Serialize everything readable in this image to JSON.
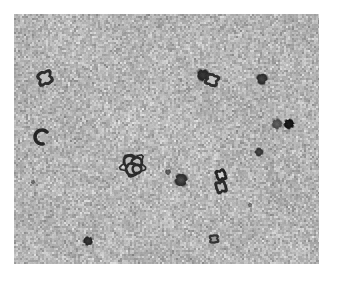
{
  "figure": {
    "kind": "electron-micrograph",
    "modality": "transmission electron microscopy, negative stain",
    "canvas": {
      "width": 337,
      "height": 281,
      "background_color": "#ffffff"
    },
    "caption": ""
  },
  "panel": {
    "label": "",
    "x": 14,
    "y": 14,
    "width": 305,
    "height": 250,
    "border_color": "#ffffff",
    "background_color": "#b2b2b2",
    "grain": {
      "description": "fine granular negative-stain background speckle",
      "min_gray": "#8e8e8e",
      "max_gray": "#d8d8d8",
      "mean_gray": "#b4b4b4",
      "cell_size_px": 2,
      "blotch_count": 140
    }
  },
  "particles": [
    {
      "id": "p01",
      "name": "ring-vesicle-upper-left",
      "shape": "ring",
      "cx": 45,
      "cy": 78,
      "r": 8.0,
      "ring_thickness": 3.2,
      "core_gray": "#c2c2c2",
      "edge_gray": "#2e2e2e"
    },
    {
      "id": "p02",
      "name": "dark-blob-upper-mid-right",
      "shape": "blob",
      "cx": 203,
      "cy": 75,
      "r": 6.5,
      "ring_thickness": 0,
      "core_gray": "#3a3a3a",
      "edge_gray": "#242424"
    },
    {
      "id": "p03",
      "name": "ring-vesicle-upper-mid-right",
      "shape": "ring",
      "cx": 212,
      "cy": 80,
      "r": 7.0,
      "ring_thickness": 3.0,
      "core_gray": "#c6c6c6",
      "edge_gray": "#303030"
    },
    {
      "id": "p04",
      "name": "dark-blob-upper-right",
      "shape": "blob",
      "cx": 262,
      "cy": 79,
      "r": 6.0,
      "ring_thickness": 0,
      "core_gray": "#4a4a4a",
      "edge_gray": "#2a2a2a"
    },
    {
      "id": "p05",
      "name": "gray-blob-right-upper",
      "shape": "blob",
      "cx": 277,
      "cy": 124,
      "r": 5.5,
      "ring_thickness": 0,
      "core_gray": "#666666",
      "edge_gray": "#484848"
    },
    {
      "id": "p06",
      "name": "solid-dark-round-right",
      "shape": "blob",
      "cx": 289,
      "cy": 124,
      "r": 5.5,
      "ring_thickness": 0,
      "core_gray": "#1d1d1d",
      "edge_gray": "#111111"
    },
    {
      "id": "p07",
      "name": "crescent-particle-left-mid",
      "shape": "crescent",
      "cx": 42,
      "cy": 137,
      "r": 7.0,
      "ring_thickness": 3.5,
      "core_gray": "#b0b0b0",
      "edge_gray": "#262626"
    },
    {
      "id": "p08",
      "name": "small-blob-right-mid",
      "shape": "blob",
      "cx": 259,
      "cy": 152,
      "r": 4.5,
      "ring_thickness": 0,
      "core_gray": "#4e4e4e",
      "edge_gray": "#2e2e2e"
    },
    {
      "id": "p09",
      "name": "multi-ring-cluster-center",
      "shape": "ring-cluster",
      "cx": 133,
      "cy": 165,
      "r": 11.5,
      "ring_thickness": 2.4,
      "core_gray": "#bcbcbc",
      "edge_gray": "#2c2c2c"
    },
    {
      "id": "p10",
      "name": "irregular-blob-center-right",
      "shape": "blob",
      "cx": 181,
      "cy": 180,
      "r": 7.0,
      "ring_thickness": 0,
      "core_gray": "#555555",
      "edge_gray": "#2a2a2a"
    },
    {
      "id": "p11",
      "name": "ring-doublet-upper-right-mid",
      "shape": "ring",
      "cx": 221,
      "cy": 175,
      "r": 6.0,
      "ring_thickness": 3.0,
      "core_gray": "#d0d0d0",
      "edge_gray": "#242424"
    },
    {
      "id": "p12",
      "name": "ring-doublet-lower-right-mid",
      "shape": "ring",
      "cx": 221,
      "cy": 187,
      "r": 6.5,
      "ring_thickness": 3.0,
      "core_gray": "#b8b8b8",
      "edge_gray": "#2a2a2a"
    },
    {
      "id": "p13",
      "name": "small-dark-spot-bottom-left",
      "shape": "blob",
      "cx": 88,
      "cy": 241,
      "r": 5.0,
      "ring_thickness": 0,
      "core_gray": "#3c3c3c",
      "edge_gray": "#222222"
    },
    {
      "id": "p14",
      "name": "small-ring-bottom-right",
      "shape": "ring",
      "cx": 214,
      "cy": 239,
      "r": 5.0,
      "ring_thickness": 2.4,
      "core_gray": "#9a9a9a",
      "edge_gray": "#343434"
    },
    {
      "id": "p15",
      "name": "faint-speck-center",
      "shape": "blob",
      "cx": 168,
      "cy": 172,
      "r": 3.0,
      "ring_thickness": 0,
      "core_gray": "#6a6a6a",
      "edge_gray": "#4a4a4a"
    },
    {
      "id": "p16",
      "name": "faint-speck-left-lower",
      "shape": "blob",
      "cx": 33,
      "cy": 182,
      "r": 2.2,
      "ring_thickness": 0,
      "core_gray": "#777777",
      "edge_gray": "#5a5a5a"
    },
    {
      "id": "p17",
      "name": "faint-speck-right-lower",
      "shape": "blob",
      "cx": 250,
      "cy": 205,
      "r": 2.2,
      "ring_thickness": 0,
      "core_gray": "#7c7c7c",
      "edge_gray": "#5e5e5e"
    }
  ]
}
